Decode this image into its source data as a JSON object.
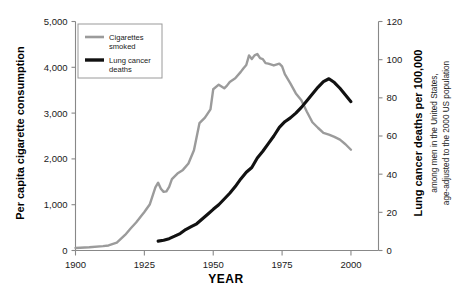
{
  "chart_data": {
    "type": "line",
    "title": "",
    "xlabel": "YEAR",
    "ylabel_left": "Per capita cigarette consumption",
    "ylabel_right": "Lung cancer deaths per 100,000",
    "ylabel_right_sub_line1": "among men in the United States,",
    "ylabel_right_sub_line2": "age-adjusted to the 2000 US population",
    "xlim": [
      1900,
      2010
    ],
    "ylim_left": [
      0,
      5000
    ],
    "ylim_right": [
      0,
      120
    ],
    "xticks": [
      1900,
      1925,
      1950,
      1975,
      2000
    ],
    "xticklabels": [
      "1900",
      "1925",
      "1950",
      "1975",
      "2000"
    ],
    "yticks_left": [
      0,
      1000,
      2000,
      3000,
      4000,
      5000
    ],
    "yticklabels_left": [
      "0",
      "1,000",
      "2,000",
      "3,000",
      "4,000",
      "5,000"
    ],
    "yticks_right": [
      0,
      20,
      40,
      60,
      80,
      100,
      120
    ],
    "yticklabels_right": [
      "0",
      "20",
      "40",
      "60",
      "80",
      "100",
      "120"
    ],
    "grid": false,
    "legend_position": "upper-left-inside",
    "colors": {
      "cigarettes": "#9b9b9b",
      "lung_cancer": "#111111",
      "axis": "#888888",
      "background": "#ffffff"
    },
    "series": [
      {
        "name": "Cigarettes smoked",
        "axis": "left",
        "color": "#9b9b9b",
        "stroke_width": 2.4,
        "x": [
          1900,
          1905,
          1910,
          1912,
          1915,
          1918,
          1920,
          1922,
          1925,
          1927,
          1929,
          1930,
          1931,
          1932,
          1933,
          1934,
          1935,
          1937,
          1939,
          1941,
          1943,
          1945,
          1947,
          1949,
          1950,
          1952,
          1954,
          1955,
          1956,
          1958,
          1960,
          1961,
          1962,
          1963,
          1964,
          1965,
          1966,
          1967,
          1968,
          1969,
          1970,
          1972,
          1974,
          1975,
          1976,
          1978,
          1980,
          1982,
          1984,
          1986,
          1988,
          1990,
          1992,
          1994,
          1996,
          1998,
          2000
        ],
        "y": [
          54,
          70,
          95,
          110,
          170,
          340,
          480,
          610,
          840,
          1010,
          1380,
          1480,
          1350,
          1280,
          1290,
          1390,
          1560,
          1680,
          1760,
          1900,
          2190,
          2780,
          2900,
          3080,
          3520,
          3620,
          3540,
          3600,
          3680,
          3760,
          3900,
          3980,
          4050,
          4260,
          4180,
          4260,
          4290,
          4200,
          4180,
          4090,
          4080,
          4040,
          4080,
          4020,
          3850,
          3650,
          3430,
          3280,
          3030,
          2800,
          2680,
          2570,
          2530,
          2480,
          2420,
          2320,
          2200
        ]
      },
      {
        "name": "Lung cancer deaths",
        "axis": "right",
        "color": "#111111",
        "stroke_width": 3.1,
        "x": [
          1930,
          1932,
          1934,
          1936,
          1938,
          1940,
          1942,
          1944,
          1946,
          1948,
          1950,
          1952,
          1954,
          1956,
          1958,
          1960,
          1962,
          1964,
          1966,
          1968,
          1970,
          1972,
          1974,
          1976,
          1978,
          1980,
          1982,
          1984,
          1986,
          1988,
          1990,
          1992,
          1994,
          1996,
          1998,
          2000
        ],
        "y": [
          4.9,
          5.4,
          6.2,
          7.5,
          8.9,
          11.0,
          12.5,
          14.0,
          16.5,
          19.0,
          21.6,
          24.0,
          27.0,
          30.0,
          33.5,
          37.5,
          41.0,
          43.5,
          48.5,
          52.0,
          56.0,
          60.0,
          64.5,
          67.5,
          69.5,
          72.0,
          75.0,
          78.5,
          82.0,
          85.5,
          88.5,
          90.0,
          88.0,
          85.0,
          81.5,
          78.0
        ]
      }
    ],
    "legend": [
      {
        "label_line1": "Cigarettes",
        "label_line2": "smoked",
        "color": "#9b9b9b",
        "thickness": 2.6
      },
      {
        "label_line1": "Lung cancer",
        "label_line2": "deaths",
        "color": "#111111",
        "thickness": 3.4
      }
    ]
  }
}
